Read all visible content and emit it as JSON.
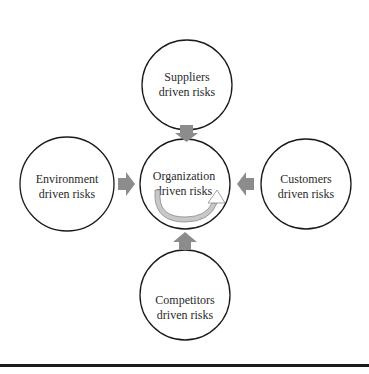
{
  "diagram": {
    "center": {
      "line1": "Organization",
      "line2": "driven risks"
    },
    "top": {
      "line1": "Suppliers",
      "line2": "driven risks"
    },
    "left": {
      "line1": "Environment",
      "line2": "driven risks"
    },
    "right": {
      "line1": "Customers",
      "line2": "driven risks"
    },
    "bottom": {
      "line1": "Competitors",
      "line2": "driven risks"
    }
  },
  "colors": {
    "arrow": "#8c8c8c",
    "stroke": "#1a1a1a",
    "cycle_arrow": "#b0b0b0"
  }
}
